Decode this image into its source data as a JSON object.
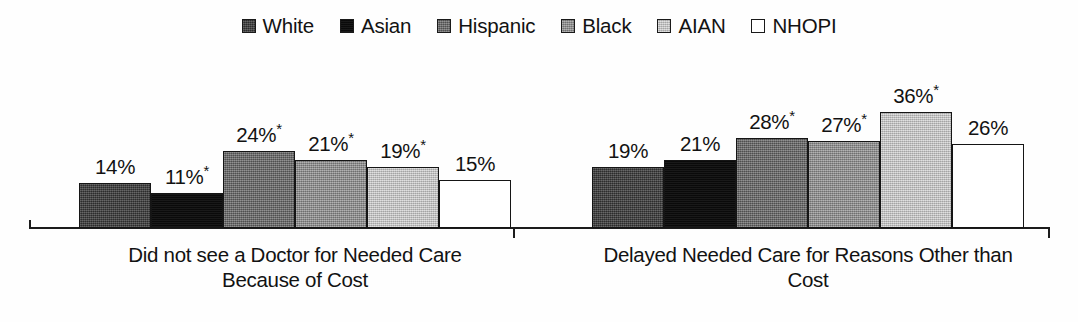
{
  "chart_data": {
    "type": "bar",
    "title": "",
    "xlabel": "",
    "ylabel": "",
    "grid": false,
    "legend_position": "top-center",
    "value_suffix": "%",
    "ylim": [
      0,
      40
    ],
    "categories": [
      "Did not see a Doctor for Needed Care Because of Cost",
      "Delayed Needed Care for Reasons Other than Cost"
    ],
    "series": [
      {
        "name": "White",
        "color": "#3d3d3d",
        "values": [
          14,
          19
        ],
        "labels": [
          "14%",
          "19%"
        ],
        "significant": [
          false,
          false
        ]
      },
      {
        "name": "Asian",
        "color": "#0d0d0d",
        "values": [
          11,
          21
        ],
        "labels": [
          "11%",
          "21%"
        ],
        "significant": [
          true,
          false
        ]
      },
      {
        "name": "Hispanic",
        "color": "#6a6a6a",
        "values": [
          24,
          28
        ],
        "labels": [
          "24%",
          "28%"
        ],
        "significant": [
          true,
          true
        ]
      },
      {
        "name": "Black",
        "color": "#8e8e8e",
        "values": [
          21,
          27
        ],
        "labels": [
          "21%",
          "27%"
        ],
        "significant": [
          true,
          true
        ]
      },
      {
        "name": "AIAN",
        "color": "#c7c7c7",
        "values": [
          19,
          36
        ],
        "labels": [
          "19%",
          "36%"
        ],
        "significant": [
          true,
          true
        ]
      },
      {
        "name": "NHOPI",
        "color": "#ffffff",
        "values": [
          15,
          26
        ],
        "labels": [
          "15%",
          "26%"
        ],
        "significant": [
          false,
          false
        ]
      }
    ],
    "significance_marker": "*"
  },
  "legend": {
    "items": [
      {
        "label": "White",
        "swatch": "dark-gray-textured"
      },
      {
        "label": "Asian",
        "swatch": "black"
      },
      {
        "label": "Hispanic",
        "swatch": "medium-dark-gray"
      },
      {
        "label": "Black",
        "swatch": "medium-gray"
      },
      {
        "label": "AIAN",
        "swatch": "light-gray"
      },
      {
        "label": "NHOPI",
        "swatch": "white"
      }
    ]
  },
  "axis": {
    "group_labels": [
      {
        "line1": "Did not see a Doctor for Needed Care",
        "line2": "Because of Cost"
      },
      {
        "line1": "Delayed Needed Care for Reasons Other than",
        "line2": "Cost"
      }
    ]
  }
}
